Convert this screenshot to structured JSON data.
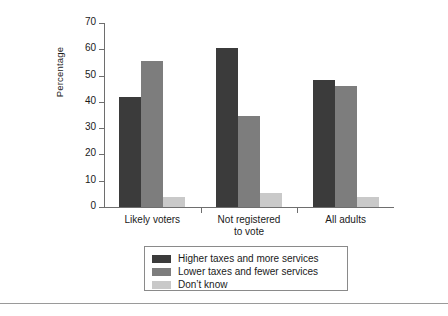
{
  "chart_data": {
    "type": "bar",
    "title": "",
    "subtitle": "",
    "xlabel": "",
    "ylabel": "Percentage",
    "ylim": [
      0,
      70
    ],
    "yticks": [
      0,
      10,
      20,
      30,
      40,
      50,
      60,
      70
    ],
    "ytick_labels": [
      "0",
      "10",
      "20",
      "30",
      "40",
      "50",
      "60",
      "70"
    ],
    "grid": false,
    "legend_position": "bottom",
    "categories": [
      "Likely voters",
      "Not registered to vote",
      "All adults"
    ],
    "category_label_lines": [
      [
        "Likely voters"
      ],
      [
        "Not registered",
        "to vote"
      ],
      [
        "All adults"
      ]
    ],
    "series": [
      {
        "name": "Higher taxes and more services",
        "color": "#3b3b3b",
        "values": [
          42,
          60.5,
          48.5
        ]
      },
      {
        "name": "Lower taxes and fewer services",
        "color": "#7d7d7d",
        "values": [
          55.5,
          34.5,
          46
        ]
      },
      {
        "name": "Don't know",
        "color": "#c9c9c9",
        "values": [
          4,
          5.5,
          4
        ]
      }
    ]
  },
  "legend": {
    "items": [
      {
        "label": "Higher taxes and more services",
        "color": "#3b3b3b"
      },
      {
        "label": "Lower taxes and fewer services",
        "color": "#7d7d7d"
      },
      {
        "label": "Don’t know",
        "color": "#c9c9c9"
      }
    ]
  },
  "axis": {
    "y_title": "Percentage",
    "y_tick_labels": [
      "70",
      "60",
      "50",
      "40",
      "30",
      "20",
      "10",
      "0"
    ]
  },
  "colors": {
    "axis": "#6e6e6e",
    "text": "#1a1a1a",
    "background": "#ffffff",
    "legend_border": "#8a8a8a",
    "rule": "#9a9a9a"
  }
}
